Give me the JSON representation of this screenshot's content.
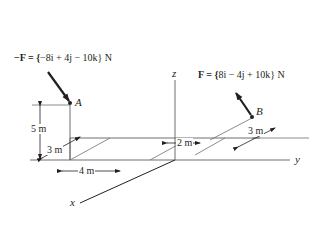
{
  "figure": {
    "type": "3D statics force diagram",
    "axes": {
      "x": "x",
      "y": "y",
      "z": "z"
    },
    "points": {
      "A": {
        "label": "A"
      },
      "B": {
        "label": "B"
      }
    },
    "forces": {
      "neg_F": {
        "prefix": "−F = {",
        "expression": "−8i + 4j − 10k",
        "suffix": "} N",
        "applied_at": "A"
      },
      "F": {
        "prefix": "F = {",
        "expression": "8i − 4j + 10k",
        "suffix": "} N",
        "applied_at": "B"
      }
    },
    "dimensions": {
      "height_A": "5 m",
      "depth_left": "3 m",
      "width_left": "4 m",
      "offset_y": "2 m",
      "depth_B": "3 m"
    },
    "colors": {
      "ink": "#231f20",
      "line": "#6d6e71",
      "background": "#ffffff"
    }
  }
}
